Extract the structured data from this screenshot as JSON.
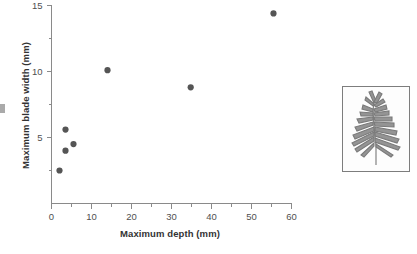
{
  "chart_data": {
    "type": "scatter",
    "title": "",
    "xlabel": "Maximum depth (mm)",
    "ylabel": "Maximum blade width (mm)",
    "xlim": [
      0,
      60
    ],
    "ylim": [
      0,
      15
    ],
    "x_ticks": [
      0,
      10,
      20,
      30,
      40,
      50,
      60
    ],
    "x_tick_labels": [
      "0",
      "10",
      "20",
      "30",
      "40",
      "50",
      "60"
    ],
    "x_minor_ticks": [
      5,
      15,
      25,
      35,
      45,
      55
    ],
    "y_ticks": [
      5,
      10,
      15
    ],
    "y_tick_labels": [
      "5",
      "10",
      "15"
    ],
    "y_minor_ticks": [
      2.5,
      7.5,
      12.5
    ],
    "grid": false,
    "legend": false,
    "marker": "filled-circle",
    "marker_color": "#555555",
    "axis_color": "#8a8a8a",
    "points": [
      {
        "x": 2.0,
        "y": 2.5
      },
      {
        "x": 3.5,
        "y": 4.0
      },
      {
        "x": 3.5,
        "y": 5.6
      },
      {
        "x": 5.5,
        "y": 4.5
      },
      {
        "x": 14.0,
        "y": 10.1
      },
      {
        "x": 34.8,
        "y": 8.8
      },
      {
        "x": 55.5,
        "y": 14.4
      }
    ]
  },
  "inset": {
    "name": "plant-specimen-photo",
    "description": "Pressed leafy plant specimen with narrow lobed blades"
  }
}
